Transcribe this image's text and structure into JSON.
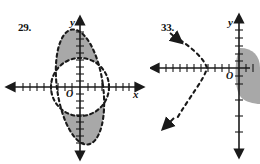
{
  "page": {
    "background": "#ffffff",
    "ink": "#1a1a1a",
    "shade_fill": "#a8a8a8",
    "width": 260,
    "height": 164
  },
  "figures": [
    {
      "number": "29.",
      "axis_x_label": "x",
      "axis_y_label": "y",
      "origin_label": "O",
      "description": "Vertical ellipse overlapping a circle; shaded regions are the parts of the tall ellipse lying outside the circle (top and bottom lens caps).",
      "curves": [
        {
          "name": "tall-ellipse",
          "type": "ellipse",
          "style": "dashed",
          "center": [
            0,
            0
          ],
          "rx": 1.9,
          "ry": 5.2,
          "rotation_deg": -8
        },
        {
          "name": "circle",
          "type": "circle",
          "style": "dashed",
          "center": [
            0,
            0
          ],
          "r": 2.6
        }
      ],
      "shaded_regions": [
        {
          "name": "upper-cap",
          "fill": "#a8a8a8"
        },
        {
          "name": "lower-cap",
          "fill": "#a8a8a8"
        }
      ],
      "x_axis": {
        "ticks": 18,
        "arrows": [
          "left",
          "right"
        ]
      },
      "y_axis": {
        "ticks": 16,
        "arrows": [
          "up",
          "down"
        ]
      }
    },
    {
      "number": "33.",
      "axis_x_label": "",
      "axis_y_label": "y",
      "origin_label": "O",
      "description": "Leftward-opening dashed parabola with arrowheads on both branches; shaded region to the right of the y-axis.",
      "curves": [
        {
          "name": "parabola",
          "type": "parabola",
          "style": "dashed",
          "opens": "left",
          "vertex": [
            -2.0,
            0
          ],
          "arrows": [
            "upper-left",
            "lower-left"
          ]
        }
      ],
      "shaded_regions": [
        {
          "name": "right-region",
          "fill": "#a8a8a8"
        }
      ],
      "x_axis": {
        "ticks": 14,
        "arrows": [
          "left"
        ]
      },
      "y_axis": {
        "ticks": 12,
        "arrows": [
          "up",
          "down"
        ]
      }
    }
  ]
}
